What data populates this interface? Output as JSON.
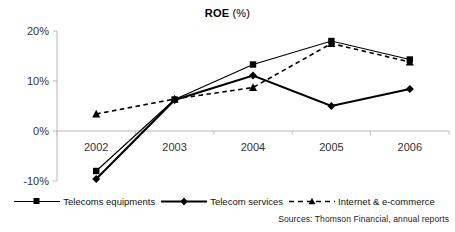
{
  "chart_data": {
    "type": "line",
    "title_main": "ROE",
    "title_unit": "(%)",
    "xlabel": "",
    "ylabel": "",
    "categories": [
      "2002",
      "2003",
      "2004",
      "2005",
      "2006"
    ],
    "ylim": [
      -10,
      20
    ],
    "yticks": [
      20,
      10,
      0,
      -10
    ],
    "ytick_labels": [
      "20%",
      "10%",
      "0%",
      "-10%"
    ],
    "grid": false,
    "legend_position": "bottom",
    "series": [
      {
        "name": "Telecoms equipments",
        "marker": "square",
        "line_style": "solid",
        "color": "#000000",
        "values": [
          -8.0,
          6.3,
          13.3,
          18.0,
          14.3
        ]
      },
      {
        "name": "Telecom services",
        "marker": "diamond",
        "line_style": "solid",
        "color": "#000000",
        "values": [
          -9.6,
          6.2,
          11.1,
          5.0,
          8.4
        ]
      },
      {
        "name": "Internet & e-commerce",
        "marker": "triangle",
        "line_style": "dashed",
        "color": "#000000",
        "values": [
          3.4,
          6.4,
          8.7,
          17.5,
          13.8
        ]
      }
    ],
    "source_note": "Sources: Thomson Financial, annual reports"
  }
}
